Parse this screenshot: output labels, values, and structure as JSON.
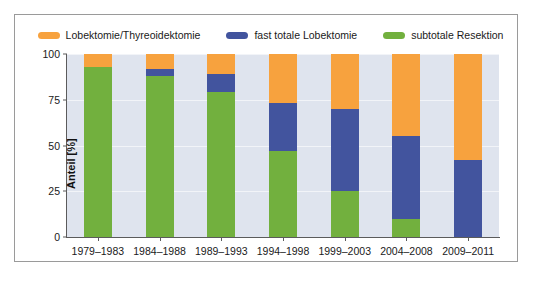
{
  "chart_data": {
    "type": "bar",
    "stacked": true,
    "stack_mode": "percent",
    "title": "",
    "subtitle": "",
    "xlabel": "",
    "ylabel": "Anteil [%]",
    "ylim": [
      0,
      100
    ],
    "yticks": [
      0,
      25,
      50,
      75,
      100
    ],
    "ytick_labels": [
      "0",
      "25",
      "50",
      "75",
      "100"
    ],
    "grid": true,
    "grid_axis": "y",
    "legend_position": "top-center",
    "categories": [
      "1979–1983",
      "1984–1988",
      "1989–1993",
      "1994–1998",
      "1999–2003",
      "2004–2008",
      "2009–2011"
    ],
    "series": [
      {
        "name": "subtotale Resektion",
        "color": "#72B03E",
        "values": [
          93,
          88,
          79,
          47,
          25,
          10,
          0
        ]
      },
      {
        "name": "fast totale Lobektomie",
        "color": "#42549E",
        "values": [
          0,
          4,
          10,
          26,
          45,
          45,
          42
        ]
      },
      {
        "name": "Lobektomie/Thyreoidektomie",
        "color": "#F7A23E",
        "values": [
          7,
          8,
          11,
          27,
          30,
          45,
          58
        ]
      }
    ],
    "legend": [
      {
        "label": "Lobektomie/Thyreoidektomie",
        "color": "#F7A23E"
      },
      {
        "label": "fast totale Lobektomie",
        "color": "#42549E"
      },
      {
        "label": "subtotale Resektion",
        "color": "#72B03E"
      }
    ],
    "colors": {
      "orange": "#F7A23E",
      "blue": "#42549E",
      "green": "#72B03E",
      "plot_background": "#dfe4ee",
      "gridline": "#f2f4f8",
      "axis": "#5b5b5b",
      "frame": "#9a9a9a",
      "text": "#1a1a1a"
    }
  }
}
